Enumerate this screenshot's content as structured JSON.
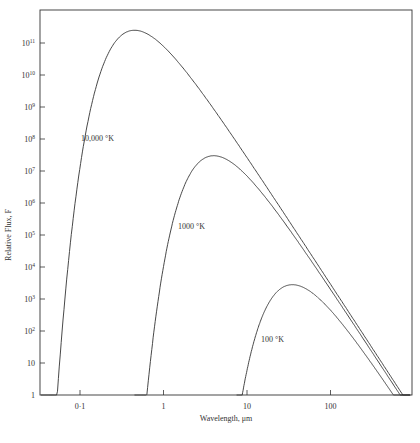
{
  "chart_data": {
    "type": "line",
    "title": "",
    "xlabel": "Wavelength, μm",
    "ylabel": "Relative Flux, F",
    "x_scale": "log",
    "y_scale": "log",
    "xlim": [
      0.032,
      900
    ],
    "ylim": [
      1,
      1000000000000.0
    ],
    "grid": false,
    "legend": "none (inline annotations)",
    "x_ticks": [
      {
        "value": 0.1,
        "label": "0·1"
      },
      {
        "value": 1,
        "label": "1"
      },
      {
        "value": 10,
        "label": "10"
      },
      {
        "value": 100,
        "label": "100"
      }
    ],
    "y_ticks": [
      {
        "value": 1,
        "base": "1",
        "exp": ""
      },
      {
        "value": 10,
        "base": "10",
        "exp": ""
      },
      {
        "value": 100,
        "base": "10",
        "exp": "2"
      },
      {
        "value": 1000,
        "base": "10",
        "exp": "3"
      },
      {
        "value": 10000,
        "base": "10",
        "exp": "4"
      },
      {
        "value": 100000,
        "base": "10",
        "exp": "5"
      },
      {
        "value": 1000000,
        "base": "10",
        "exp": "6"
      },
      {
        "value": 10000000,
        "base": "10",
        "exp": "7"
      },
      {
        "value": 100000000,
        "base": "10",
        "exp": "8"
      },
      {
        "value": 1000000000,
        "base": "10",
        "exp": "9"
      },
      {
        "value": 10000000000,
        "base": "10",
        "exp": "10"
      },
      {
        "value": 100000000000,
        "base": "10",
        "exp": "11"
      }
    ],
    "series": [
      {
        "name": "10,000 °K",
        "temperature_K": 10000,
        "peak_wavelength_um": 0.45,
        "peak_flux": 250000000000.0,
        "starts_at_um": 0.034,
        "label_pos": {
          "x": 81,
          "y": 141
        }
      },
      {
        "name": "1000 °K",
        "temperature_K": 1000,
        "peak_wavelength_um": 4.0,
        "peak_flux": 30000000.0,
        "starts_at_um": 0.45,
        "label_pos": {
          "x": 178,
          "y": 229
        }
      },
      {
        "name": "100 °K",
        "temperature_K": 100,
        "peak_wavelength_um": 35,
        "peak_flux": 2800.0,
        "starts_at_um": 7.5,
        "label_pos": {
          "x": 261,
          "y": 342
        }
      }
    ]
  },
  "plot": {
    "left": 40,
    "right": 412,
    "top": 10,
    "bottom": 395,
    "x_px_per_decade": 83.5,
    "x_at_1um": 163.5,
    "y_px_per_decade": 32.0,
    "y_at_1": 395
  }
}
